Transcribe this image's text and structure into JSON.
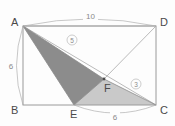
{
  "figure": {
    "background_color": "#fdfdfd",
    "outline_color": "#9a9a9a",
    "dark_shade_color": "#8c8c8c",
    "light_shade_color": "#c9c9c9",
    "label_color": "#4a4a4a",
    "dim_color": "#8a8a8a"
  },
  "vertices": {
    "A": "A",
    "B": "B",
    "C": "C",
    "D": "D",
    "E": "E",
    "F": "F"
  },
  "dimensions": {
    "top": "10",
    "left": "6",
    "bottom": "6"
  },
  "segment_labels": {
    "af": "5",
    "fc": "3"
  }
}
